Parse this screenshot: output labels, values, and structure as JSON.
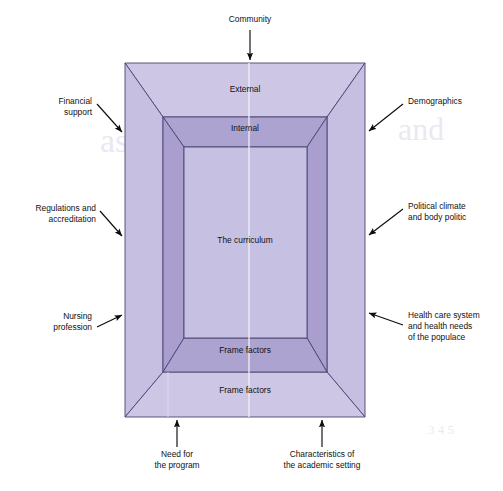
{
  "figure": {
    "type": "nested-frame-diagram",
    "background_color": "#ffffff",
    "palette": {
      "outer_face": "#cfc9e6",
      "outer_side": "#c3bce0",
      "middle_face": "#b0a6d2",
      "middle_side": "#a79cce",
      "inner_face": "#c7c1e3",
      "stroke": "#4a4470",
      "text": "#111111"
    }
  },
  "zones": {
    "outer_top_label": "External",
    "middle_top_label": "Internal",
    "center_label": "The curriculum",
    "middle_bottom_label": "Frame factors",
    "outer_bottom_label": "Frame factors"
  },
  "callouts": [
    {
      "id": "community",
      "label_lines": [
        "Community"
      ],
      "position": "top",
      "anchor": "middle",
      "text_x": 250,
      "text_y": 22,
      "arrow": {
        "x1": 250,
        "y1": 30,
        "x2": 250,
        "y2": 62
      }
    },
    {
      "id": "financial-support",
      "label_lines": [
        "Financial",
        "support"
      ],
      "position": "left",
      "anchor": "end",
      "text_x": 92,
      "text_y": 105,
      "arrow": {
        "x1": 88,
        "y1": 110,
        "x2": 124,
        "y2": 134
      }
    },
    {
      "id": "regulations-and-accreditation",
      "label_lines": [
        "Regulations and",
        "accreditation"
      ],
      "position": "left",
      "anchor": "end",
      "text_x": 94,
      "text_y": 210,
      "arrow": {
        "x1": 90,
        "y1": 215,
        "x2": 124,
        "y2": 237
      }
    },
    {
      "id": "nursing-profession",
      "label_lines": [
        "Nursing",
        "profession"
      ],
      "position": "left",
      "anchor": "end",
      "text_x": 92,
      "text_y": 318,
      "arrow": {
        "x1": 96,
        "y1": 325,
        "x2": 124,
        "y2": 317
      }
    },
    {
      "id": "demographics",
      "label_lines": [
        "Demographics"
      ],
      "position": "right",
      "anchor": "start",
      "text_x": 408,
      "text_y": 104,
      "arrow": {
        "x1": 404,
        "y1": 108,
        "x2": 367,
        "y2": 133
      }
    },
    {
      "id": "political-climate-and-body-politic",
      "label_lines": [
        "Political climate",
        "and body politic"
      ],
      "position": "right",
      "anchor": "start",
      "text_x": 408,
      "text_y": 208,
      "arrow": {
        "x1": 404,
        "y1": 213,
        "x2": 367,
        "y2": 237
      }
    },
    {
      "id": "health-care-system-and-health-needs",
      "label_lines": [
        "Health care system",
        "and health needs",
        "of the populace"
      ],
      "position": "right",
      "anchor": "start",
      "text_x": 408,
      "text_y": 317,
      "arrow": {
        "x1": 404,
        "y1": 322,
        "x2": 367,
        "y2": 314
      }
    },
    {
      "id": "need-for-the-program",
      "label_lines": [
        "Need for",
        "the program"
      ],
      "position": "bottom",
      "anchor": "middle",
      "text_x": 177,
      "text_y": 456,
      "arrow": {
        "x1": 177,
        "y1": 448,
        "x2": 177,
        "y2": 419
      }
    },
    {
      "id": "characteristics-of-the-academic-setting",
      "label_lines": [
        "Characteristics of",
        "the academic setting"
      ],
      "position": "bottom",
      "anchor": "middle",
      "text_x": 322,
      "text_y": 456,
      "arrow": {
        "x1": 322,
        "y1": 448,
        "x2": 322,
        "y2": 419
      }
    }
  ],
  "geometry": {
    "outer": {
      "x1": 125,
      "y1": 63,
      "x2": 365,
      "y2": 417
    },
    "middle_outer": {
      "x1": 163,
      "y1": 117,
      "x2": 327,
      "y2": 372
    },
    "inner": {
      "x1": 184,
      "y1": 147,
      "x2": 307,
      "y2": 338
    }
  },
  "watermark": {
    "lines": [
      {
        "text": "environment",
        "x": 175,
        "y": 108,
        "size": 30
      },
      {
        "text": "assessment the",
        "x": 100,
        "y": 150,
        "size": 34
      },
      {
        "text": "the curriculum",
        "x": 150,
        "y": 193,
        "size": 30
      },
      {
        "text": "and",
        "x": 400,
        "y": 138,
        "size": 30
      },
      {
        "text": "needs  through",
        "x": 270,
        "y": 250,
        "size": 13
      },
      {
        "text": "3 4 5",
        "x": 430,
        "y": 432,
        "size": 13
      }
    ]
  }
}
